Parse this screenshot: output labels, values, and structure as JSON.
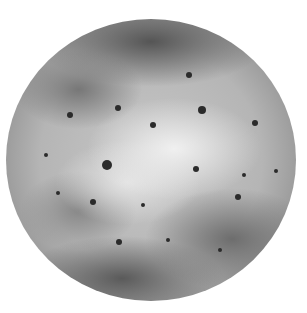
{
  "image": {
    "subject": "grayscale planetary moon",
    "background_color": "#ffffff",
    "planet": {
      "center": [
        151,
        160
      ],
      "radius": 145,
      "base_color": "#b5b5b5"
    },
    "spots": [
      {
        "x": 189,
        "y": 75,
        "r": 3
      },
      {
        "x": 153,
        "y": 125,
        "r": 3
      },
      {
        "x": 107,
        "y": 165,
        "r": 5
      },
      {
        "x": 118,
        "y": 108,
        "r": 3
      },
      {
        "x": 255,
        "y": 123,
        "r": 3
      },
      {
        "x": 244,
        "y": 175,
        "r": 2
      },
      {
        "x": 276,
        "y": 171,
        "r": 2
      },
      {
        "x": 196,
        "y": 169,
        "r": 3
      },
      {
        "x": 168,
        "y": 240,
        "r": 2
      },
      {
        "x": 119,
        "y": 242,
        "r": 3
      },
      {
        "x": 220,
        "y": 250,
        "r": 2
      },
      {
        "x": 143,
        "y": 205,
        "r": 2
      },
      {
        "x": 70,
        "y": 115,
        "r": 3
      },
      {
        "x": 46,
        "y": 155,
        "r": 2
      },
      {
        "x": 238,
        "y": 197,
        "r": 3
      },
      {
        "x": 202,
        "y": 110,
        "r": 4
      },
      {
        "x": 93,
        "y": 202,
        "r": 3
      },
      {
        "x": 58,
        "y": 193,
        "r": 2
      }
    ]
  }
}
